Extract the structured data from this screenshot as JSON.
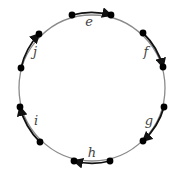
{
  "diagram": {
    "type": "cycle",
    "center": [
      92,
      88
    ],
    "radius": 73,
    "circle_color": "#8a8a8a",
    "arrow_color": "#111111",
    "dot_color": "#000000",
    "edges": [
      {
        "label": "e",
        "from": [
          72,
          15
        ],
        "to": [
          111,
          15
        ],
        "label_pos": [
          89,
          26
        ],
        "direction": "clockwise"
      },
      {
        "label": "f",
        "from": [
          143,
          33
        ],
        "to": [
          163,
          67
        ],
        "label_pos": [
          146,
          56
        ],
        "direction": "clockwise"
      },
      {
        "label": "g",
        "from": [
          164,
          107
        ],
        "to": [
          143,
          141
        ],
        "label_pos": [
          149,
          125
        ],
        "direction": "clockwise"
      },
      {
        "label": "h",
        "from": [
          110,
          161
        ],
        "to": [
          74,
          161
        ],
        "label_pos": [
          92,
          157
        ],
        "direction": "clockwise"
      },
      {
        "label": "i",
        "from": [
          40,
          142
        ],
        "to": [
          20,
          107
        ],
        "label_pos": [
          36,
          125
        ],
        "direction": "clockwise"
      },
      {
        "label": "j",
        "from": [
          21,
          68
        ],
        "to": [
          39,
          34
        ],
        "label_pos": [
          35,
          56
        ],
        "direction": "clockwise"
      }
    ]
  }
}
